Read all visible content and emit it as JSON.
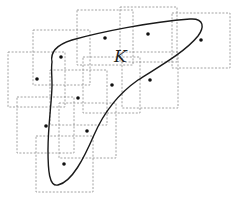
{
  "figure": {
    "label": "K",
    "label_position": {
      "x": 114,
      "y": 62
    },
    "colors": {
      "box_stroke": "#8a8a8a",
      "curve_stroke": "#1a1a1a",
      "dot_fill": "#111111",
      "background": "#ffffff"
    },
    "boxes": [
      {
        "x": 77,
        "y": 10,
        "w": 56,
        "h": 55
      },
      {
        "x": 120,
        "y": 7,
        "w": 57,
        "h": 55
      },
      {
        "x": 172,
        "y": 13,
        "w": 58,
        "h": 55
      },
      {
        "x": 33,
        "y": 30,
        "w": 57,
        "h": 55
      },
      {
        "x": 8,
        "y": 52,
        "w": 57,
        "h": 55
      },
      {
        "x": 83,
        "y": 57,
        "w": 57,
        "h": 56
      },
      {
        "x": 122,
        "y": 52,
        "w": 56,
        "h": 56
      },
      {
        "x": 50,
        "y": 70,
        "w": 57,
        "h": 55
      },
      {
        "x": 17,
        "y": 97,
        "w": 57,
        "h": 56
      },
      {
        "x": 59,
        "y": 103,
        "w": 57,
        "h": 55
      },
      {
        "x": 36,
        "y": 136,
        "w": 57,
        "h": 56
      }
    ],
    "points": [
      {
        "x": 105,
        "y": 38
      },
      {
        "x": 148,
        "y": 34
      },
      {
        "x": 201,
        "y": 40
      },
      {
        "x": 61,
        "y": 57
      },
      {
        "x": 37,
        "y": 79
      },
      {
        "x": 112,
        "y": 85
      },
      {
        "x": 150,
        "y": 80
      },
      {
        "x": 78,
        "y": 98
      },
      {
        "x": 46,
        "y": 126
      },
      {
        "x": 87,
        "y": 131
      },
      {
        "x": 64,
        "y": 164
      }
    ],
    "curve_path": "M 52 62 C 50 52, 56 45, 72 40 C 100 32, 150 22, 190 19 C 205 18, 204 28, 198 36 C 185 52, 160 66, 138 80 C 118 94, 104 112, 94 135 C 84 158, 72 182, 58 185 C 49 187, 48 170, 48 150 C 48 125, 52 100, 52 85 C 52 75, 51 68, 52 62 Z"
  }
}
